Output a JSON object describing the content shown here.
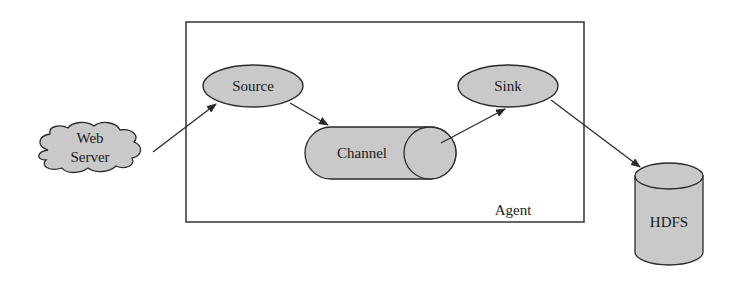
{
  "diagram": {
    "title": "",
    "container": {
      "label": "Agent"
    },
    "nodes": [
      {
        "id": "web-server",
        "label_line1": "Web",
        "label_line2": "Server",
        "shape": "cloud"
      },
      {
        "id": "source",
        "label": "Source",
        "shape": "ellipse"
      },
      {
        "id": "channel",
        "label": "Channel",
        "shape": "horizontal-cylinder"
      },
      {
        "id": "sink",
        "label": "Sink",
        "shape": "ellipse"
      },
      {
        "id": "hdfs",
        "label": "HDFS",
        "shape": "cylinder"
      }
    ],
    "edges": [
      {
        "from": "web-server",
        "to": "source"
      },
      {
        "from": "source",
        "to": "channel"
      },
      {
        "from": "channel",
        "to": "sink"
      },
      {
        "from": "sink",
        "to": "hdfs"
      }
    ],
    "colors": {
      "fill": "#c9c9c9",
      "stroke": "#2a2a2a",
      "background": "#ffffff"
    }
  }
}
